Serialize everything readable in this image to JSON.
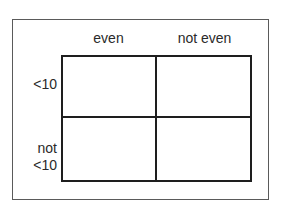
{
  "diagram": {
    "type": "2x2 classification table",
    "columns": [
      {
        "label": "even"
      },
      {
        "label": "not even"
      }
    ],
    "rows": [
      {
        "label_lines": [
          "<10"
        ]
      },
      {
        "label_lines": [
          "not",
          "<10"
        ]
      }
    ],
    "cells": [
      [
        "",
        ""
      ],
      [
        "",
        ""
      ]
    ],
    "colors": {
      "outer_border": "#5a5a5a",
      "grid_lines": "#1e1e1e",
      "text": "#2a2a2a",
      "background": "#ffffff"
    }
  }
}
